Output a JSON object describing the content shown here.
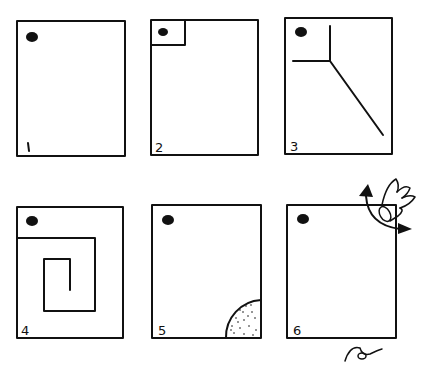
{
  "diagram": {
    "ink_color": "#111111",
    "background": "#ffffff",
    "panels": [
      {
        "number": "1",
        "label": "1",
        "content": "empty rectangle with dot in top-left corner"
      },
      {
        "number": "2",
        "label": "2",
        "content": "small square drawn around dot in top-left corner"
      },
      {
        "number": "3",
        "label": "3",
        "content": "corner lines branching into diagonal line toward bottom-right"
      },
      {
        "number": "4",
        "label": "4",
        "content": "spiral path starting below dot"
      },
      {
        "number": "5",
        "label": "5",
        "content": "stippled quarter circle in bottom-right corner"
      },
      {
        "number": "6",
        "label": "6",
        "content": "hand with curved arrow folding top-right corner"
      }
    ],
    "signature": "signature"
  }
}
